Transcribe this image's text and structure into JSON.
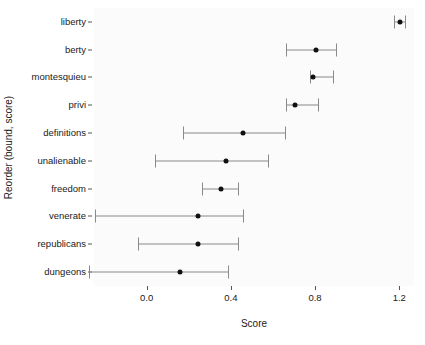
{
  "chart_data": {
    "type": "scatter",
    "title": "",
    "xlabel": "Score",
    "ylabel": "Reorder (bound, score)",
    "xlim": [
      -0.25,
      1.27
    ],
    "xticks": [
      0.0,
      0.4,
      0.8,
      1.2
    ],
    "xticklabels": [
      "0.0",
      "0.4",
      "0.8",
      "1.2"
    ],
    "grid": false,
    "legend": null,
    "orientation": "horizontal",
    "marker_color": "#111111",
    "errorbar_color": "#8a8a8a",
    "categories": [
      "liberty",
      "berty",
      "montesquieu",
      "privi",
      "definitions",
      "unalienable",
      "freedom",
      "venerate",
      "republicans",
      "dungeons"
    ],
    "points": [
      {
        "label": "liberty",
        "score": 1.205,
        "low": 1.175,
        "high": 1.225
      },
      {
        "label": "berty",
        "score": 0.805,
        "low": 0.66,
        "high": 0.9
      },
      {
        "label": "montesquieu",
        "score": 0.79,
        "low": 0.775,
        "high": 0.885
      },
      {
        "label": "privi",
        "score": 0.705,
        "low": 0.66,
        "high": 0.815
      },
      {
        "label": "definitions",
        "score": 0.46,
        "low": 0.175,
        "high": 0.655
      },
      {
        "label": "unalienable",
        "score": 0.375,
        "low": 0.04,
        "high": 0.575
      },
      {
        "label": "freedom",
        "score": 0.355,
        "low": 0.265,
        "high": 0.435
      },
      {
        "label": "venerate",
        "score": 0.245,
        "low": -0.245,
        "high": 0.46
      },
      {
        "label": "republicans",
        "score": 0.245,
        "low": -0.04,
        "high": 0.435
      },
      {
        "label": "dungeons",
        "score": 0.16,
        "low": -0.275,
        "high": 0.385
      }
    ]
  }
}
